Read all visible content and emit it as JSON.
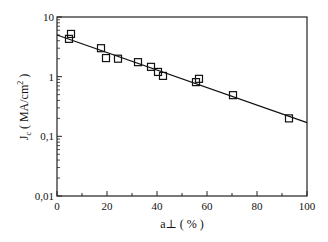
{
  "chart_data": {
    "type": "scatter",
    "title": "",
    "xlabel": "a⊥ ( % )",
    "ylabel_main": "J",
    "ylabel_sub": "c",
    "ylabel_rest": "( MA/cm",
    "ylabel_sup": "2",
    "ylabel_close": " )",
    "xlim": [
      0,
      100
    ],
    "ylim": [
      0.01,
      10
    ],
    "yscale": "log",
    "grid": false,
    "legend": null,
    "x_ticks": [
      0,
      20,
      40,
      60,
      80,
      100
    ],
    "x_tick_labels": [
      "0",
      "20",
      "40",
      "60",
      "80",
      "100"
    ],
    "x_minor_ticks": [
      10,
      30,
      50,
      70,
      90
    ],
    "y_ticks": [
      0.01,
      0.1,
      1,
      10
    ],
    "y_tick_labels": [
      "0,01",
      "0,1",
      "1",
      "10"
    ],
    "series": [
      {
        "name": "data",
        "marker": "open-square",
        "points": [
          {
            "x": 4.8,
            "y": 4.3
          },
          {
            "x": 5.6,
            "y": 5.2
          },
          {
            "x": 17.6,
            "y": 3.0
          },
          {
            "x": 19.6,
            "y": 2.05
          },
          {
            "x": 24.4,
            "y": 2.0
          },
          {
            "x": 32.4,
            "y": 1.75
          },
          {
            "x": 37.6,
            "y": 1.46
          },
          {
            "x": 40.4,
            "y": 1.2
          },
          {
            "x": 42.4,
            "y": 1.03
          },
          {
            "x": 55.6,
            "y": 0.81
          },
          {
            "x": 56.8,
            "y": 0.92
          },
          {
            "x": 70.4,
            "y": 0.49
          },
          {
            "x": 92.8,
            "y": 0.2
          }
        ]
      },
      {
        "name": "fit",
        "type": "line",
        "points": [
          {
            "x": 0,
            "y": 5.0
          },
          {
            "x": 100,
            "y": 0.17
          }
        ]
      }
    ]
  }
}
